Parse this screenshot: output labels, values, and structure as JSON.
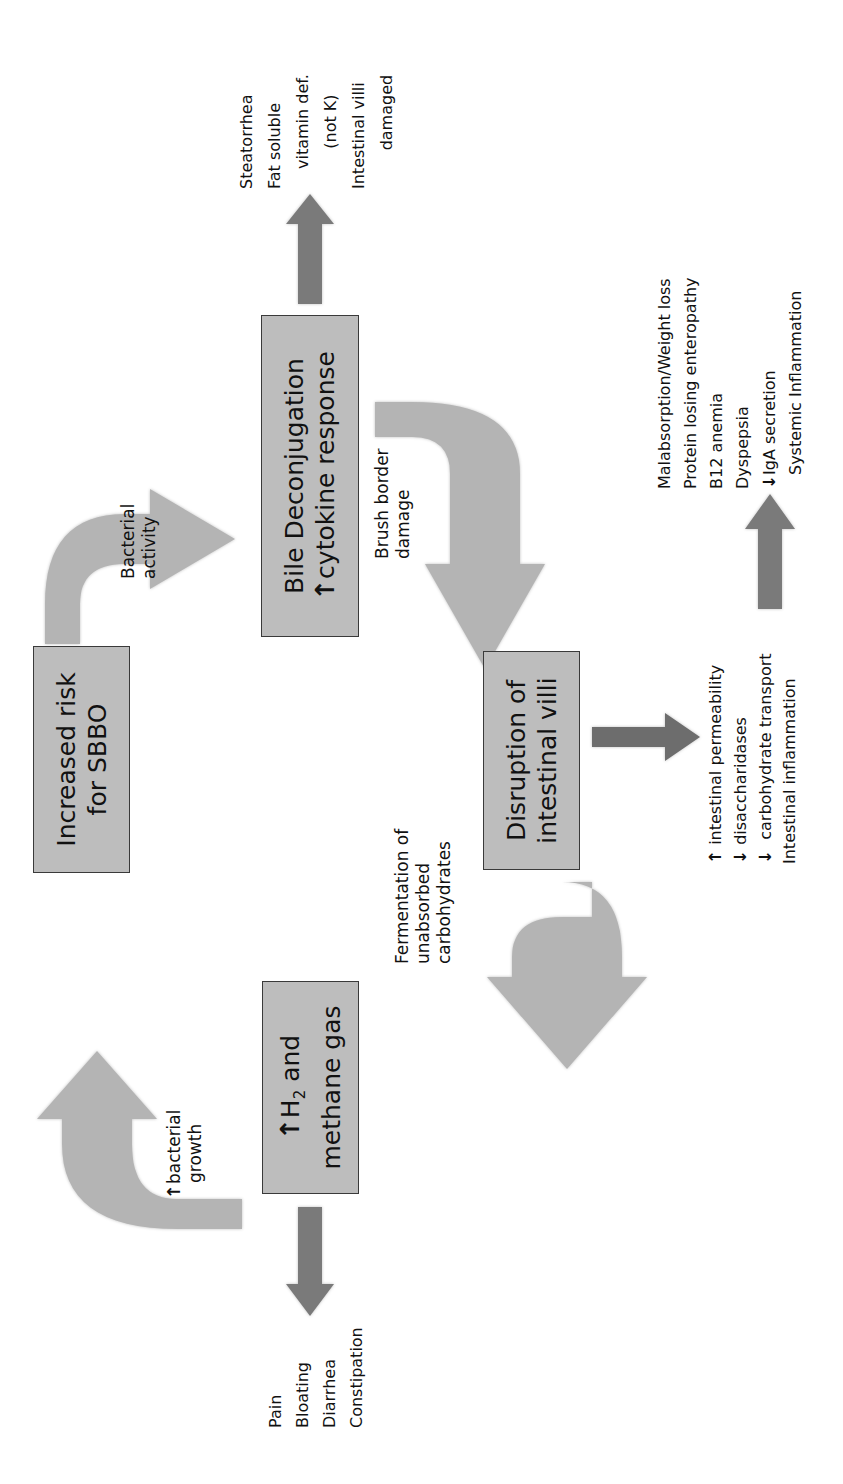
{
  "diagram": {
    "orientation": "rotated -90deg (text reads bottom-to-top)",
    "boxes": {
      "sbbo": {
        "line1": "Increased risk",
        "line2": "for SBBO"
      },
      "bile": {
        "line1": "Bile Deconjugation",
        "line2_arrow": "↑",
        "line2": "cytokine response"
      },
      "villi": {
        "line1": "Disruption of",
        "line2": "intestinal villi"
      },
      "gas": {
        "line1_arrow": "↑",
        "line1_pre": "H",
        "line1_sub": "2",
        "line1_post": " and",
        "line2": "methane gas"
      }
    },
    "cycle_labels": {
      "bacterial_activity": {
        "line1": "Bacterial",
        "line2": "activity"
      },
      "brush_border": {
        "line1": "Brush border",
        "line2": "damage"
      },
      "fermentation": {
        "line1": "Fermentation of",
        "line2": "unabsorbed",
        "line3": "carbohydrates"
      },
      "bacterial_growth": {
        "arrow": "↑",
        "line1": "bacterial",
        "line2": "growth"
      }
    },
    "outcomes": {
      "bile_effects": [
        "Steatorrhea",
        "Fat soluble",
        "vitamin def.",
        "(not K)",
        "Intestinal villi",
        "damaged"
      ],
      "villi_effects": [
        {
          "arrow": "↑",
          "text": "intestinal permeability"
        },
        {
          "arrow": "↓",
          "text": "disaccharidases"
        },
        {
          "arrow": "↓",
          "text": "carbohydrate transport"
        },
        {
          "arrow": "",
          "text": "Intestinal inflammation"
        }
      ],
      "systemic_effects": [
        {
          "arrow": "",
          "text": "Malabsorption/Weight loss"
        },
        {
          "arrow": "",
          "text": "Protein losing enteropathy"
        },
        {
          "arrow": "",
          "text": "B12 anemia"
        },
        {
          "arrow": "",
          "text": "Dyspepsia"
        },
        {
          "arrow": "↓",
          "text": "IgA secretion"
        },
        {
          "arrow": "",
          "text": "Systemic Inflammation"
        }
      ],
      "gas_effects": [
        "Pain",
        "Bloating",
        "Diarrhea",
        "Constipation"
      ]
    },
    "colors": {
      "box_fill": "#bdbdbd",
      "box_border": "#3a3a3a",
      "cycle_arrow": "#b4b4b4",
      "outcome_arrow": "#7a7a7a"
    }
  }
}
